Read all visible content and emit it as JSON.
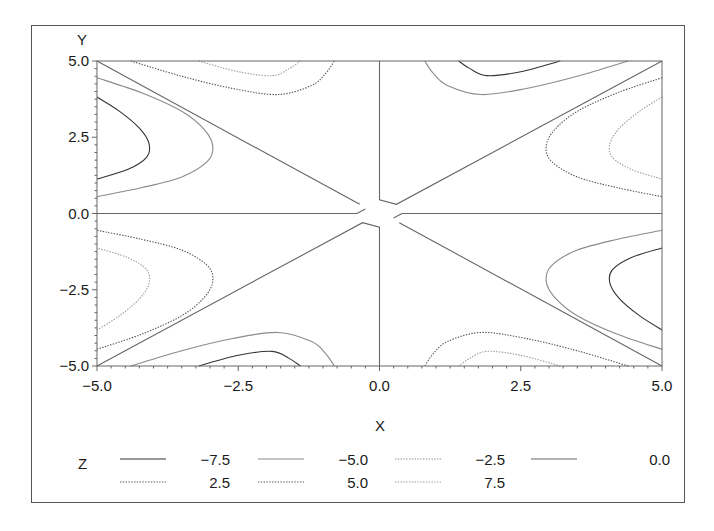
{
  "chart_data": {
    "type": "contour",
    "title": "",
    "xlabel": "X",
    "ylabel": "Y",
    "xlim": [
      -5.0,
      5.0
    ],
    "ylim": [
      -5.0,
      5.0
    ],
    "xticks": [
      "-5.0",
      "-2.5",
      "0.0",
      "2.5",
      "5.0"
    ],
    "yticks": [
      "5.0",
      "2.5",
      "0.0",
      "-2.5",
      "-5.0"
    ],
    "grid": false,
    "legend": {
      "title": "Z",
      "position": "bottom",
      "entries": [
        {
          "label": "-7.5",
          "level": -7.5,
          "style": "solid",
          "color": "#333333"
        },
        {
          "label": "-5.0",
          "level": -5.0,
          "style": "solid",
          "color": "#8a8a8a"
        },
        {
          "label": "-2.5",
          "level": -2.5,
          "style": "dotted",
          "color": "#8a8a8a"
        },
        {
          "label": "0.0",
          "level": 0.0,
          "style": "solid",
          "color": "#666666"
        },
        {
          "label": "2.5",
          "level": 2.5,
          "style": "dotted",
          "color": "#555555"
        },
        {
          "label": "5.0",
          "level": 5.0,
          "style": "dotted",
          "color": "#555555"
        },
        {
          "label": "7.5",
          "level": 7.5,
          "style": "dotted",
          "color": "#9a9a9a"
        }
      ]
    },
    "zero_lines": [
      [
        [
          -5,
          5
        ],
        [
          -0.35,
          0.3
        ]
      ],
      [
        [
          0,
          5
        ],
        [
          0,
          0.45
        ],
        [
          0.3,
          0.3
        ],
        [
          5,
          5
        ]
      ],
      [
        [
          -5,
          0
        ],
        [
          -0.4,
          0
        ],
        [
          -0.25,
          0.15
        ]
      ],
      [
        [
          0.4,
          0
        ],
        [
          5,
          0
        ]
      ],
      [
        [
          0.25,
          -0.15
        ],
        [
          0.4,
          0
        ]
      ],
      [
        [
          -5,
          -5
        ],
        [
          -0.3,
          -0.3
        ],
        [
          0,
          -0.45
        ],
        [
          0,
          -5
        ]
      ],
      [
        [
          0.35,
          -0.3
        ],
        [
          5,
          -5
        ]
      ]
    ],
    "contours": [
      {
        "level": -7.5,
        "points": [
          [
            -5,
            3.82
          ],
          [
            -4.6,
            3.35
          ],
          [
            -4.25,
            2.8
          ],
          [
            -4.08,
            2.3
          ],
          [
            -4.12,
            1.85
          ],
          [
            -4.45,
            1.45
          ],
          [
            -5,
            1.13
          ]
        ]
      },
      {
        "level": -5.0,
        "points": [
          [
            -5,
            4.45
          ],
          [
            -4.2,
            3.95
          ],
          [
            -3.5,
            3.35
          ],
          [
            -3.1,
            2.75
          ],
          [
            -2.95,
            2.2
          ],
          [
            -3.05,
            1.7
          ],
          [
            -3.5,
            1.2
          ],
          [
            -4.2,
            0.85
          ],
          [
            -5,
            0.55
          ]
        ]
      },
      {
        "level": 5.0,
        "points": [
          [
            -4.4,
            5
          ],
          [
            -3.5,
            4.5
          ],
          [
            -2.6,
            4.1
          ],
          [
            -1.8,
            3.9
          ],
          [
            -1.2,
            4.2
          ],
          [
            -0.95,
            4.6
          ],
          [
            -0.8,
            5
          ]
        ]
      },
      {
        "level": 7.5,
        "points": [
          [
            -3.2,
            5
          ],
          [
            -2.5,
            4.65
          ],
          [
            -1.9,
            4.52
          ],
          [
            -1.6,
            4.75
          ],
          [
            -1.4,
            5
          ]
        ]
      },
      {
        "level": 7.5,
        "points": [
          [
            5,
            3.82
          ],
          [
            4.6,
            3.35
          ],
          [
            4.25,
            2.8
          ],
          [
            4.08,
            2.3
          ],
          [
            4.12,
            1.85
          ],
          [
            4.45,
            1.45
          ],
          [
            5,
            1.13
          ]
        ]
      },
      {
        "level": 5.0,
        "points": [
          [
            5,
            4.45
          ],
          [
            4.2,
            3.95
          ],
          [
            3.5,
            3.35
          ],
          [
            3.1,
            2.75
          ],
          [
            2.95,
            2.2
          ],
          [
            3.05,
            1.7
          ],
          [
            3.5,
            1.2
          ],
          [
            4.2,
            0.85
          ],
          [
            5,
            0.55
          ]
        ]
      },
      {
        "level": -5.0,
        "points": [
          [
            4.4,
            5
          ],
          [
            3.5,
            4.5
          ],
          [
            2.6,
            4.1
          ],
          [
            1.8,
            3.9
          ],
          [
            1.2,
            4.2
          ],
          [
            0.95,
            4.6
          ],
          [
            0.8,
            5
          ]
        ]
      },
      {
        "level": -7.5,
        "points": [
          [
            3.2,
            5
          ],
          [
            2.5,
            4.65
          ],
          [
            1.9,
            4.52
          ],
          [
            1.6,
            4.75
          ],
          [
            1.4,
            5
          ]
        ]
      },
      {
        "level": 7.5,
        "points": [
          [
            -5,
            -3.82
          ],
          [
            -4.6,
            -3.35
          ],
          [
            -4.25,
            -2.8
          ],
          [
            -4.08,
            -2.3
          ],
          [
            -4.12,
            -1.85
          ],
          [
            -4.45,
            -1.45
          ],
          [
            -5,
            -1.13
          ]
        ]
      },
      {
        "level": 5.0,
        "points": [
          [
            -5,
            -4.45
          ],
          [
            -4.2,
            -3.95
          ],
          [
            -3.5,
            -3.35
          ],
          [
            -3.1,
            -2.75
          ],
          [
            -2.95,
            -2.2
          ],
          [
            -3.05,
            -1.7
          ],
          [
            -3.5,
            -1.2
          ],
          [
            -4.2,
            -0.85
          ],
          [
            -5,
            -0.55
          ]
        ]
      },
      {
        "level": -5.0,
        "points": [
          [
            -4.4,
            -5
          ],
          [
            -3.5,
            -4.5
          ],
          [
            -2.6,
            -4.1
          ],
          [
            -1.8,
            -3.9
          ],
          [
            -1.2,
            -4.2
          ],
          [
            -0.95,
            -4.6
          ],
          [
            -0.8,
            -5
          ]
        ]
      },
      {
        "level": -7.5,
        "points": [
          [
            -3.2,
            -5
          ],
          [
            -2.5,
            -4.65
          ],
          [
            -1.9,
            -4.52
          ],
          [
            -1.6,
            -4.75
          ],
          [
            -1.4,
            -5
          ]
        ]
      },
      {
        "level": -7.5,
        "points": [
          [
            5,
            -3.82
          ],
          [
            4.6,
            -3.35
          ],
          [
            4.25,
            -2.8
          ],
          [
            4.08,
            -2.3
          ],
          [
            4.12,
            -1.85
          ],
          [
            4.45,
            -1.45
          ],
          [
            5,
            -1.13
          ]
        ]
      },
      {
        "level": -5.0,
        "points": [
          [
            5,
            -4.45
          ],
          [
            4.2,
            -3.95
          ],
          [
            3.5,
            -3.35
          ],
          [
            3.1,
            -2.75
          ],
          [
            2.95,
            -2.2
          ],
          [
            3.05,
            -1.7
          ],
          [
            3.5,
            -1.2
          ],
          [
            4.2,
            -0.85
          ],
          [
            5,
            -0.55
          ]
        ]
      },
      {
        "level": 5.0,
        "points": [
          [
            4.4,
            -5
          ],
          [
            3.5,
            -4.5
          ],
          [
            2.6,
            -4.1
          ],
          [
            1.8,
            -3.9
          ],
          [
            1.2,
            -4.2
          ],
          [
            0.95,
            -4.6
          ],
          [
            0.8,
            -5
          ]
        ]
      },
      {
        "level": 7.5,
        "points": [
          [
            3.2,
            -5
          ],
          [
            2.5,
            -4.65
          ],
          [
            1.9,
            -4.52
          ],
          [
            1.6,
            -4.75
          ],
          [
            1.4,
            -5
          ]
        ]
      }
    ]
  },
  "axes": {
    "x_title": "X",
    "y_title": "Y"
  },
  "legend": {
    "title": "Z",
    "row1": [
      "-7.5",
      "-5.0",
      "-2.5",
      "0.0"
    ],
    "row2": [
      "2.5",
      "5.0",
      "7.5"
    ]
  }
}
